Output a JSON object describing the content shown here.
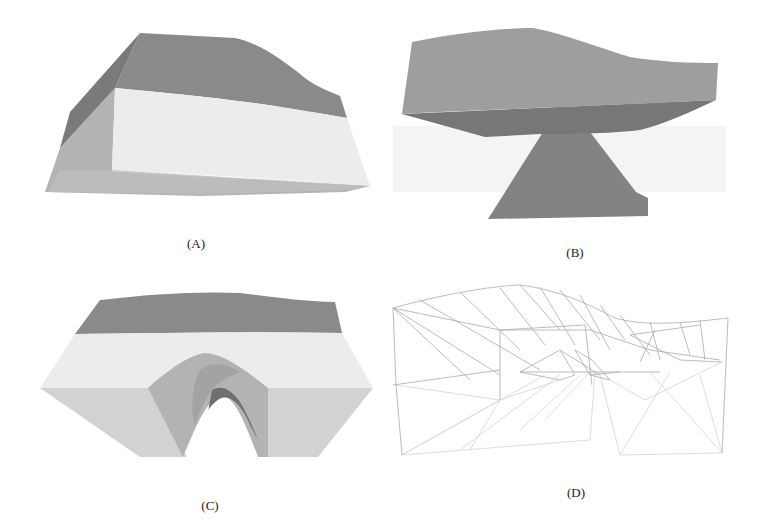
{
  "figure": {
    "panels": [
      {
        "id": "A",
        "label": "(A)",
        "description": "Shaded solid 3D model, oblique view, wavy top surface"
      },
      {
        "id": "B",
        "label": "(B)",
        "description": "Shaded solid 3D model, side view with pedestal beneath slab"
      },
      {
        "id": "C",
        "label": "(C)",
        "description": "Shaded solid 3D model, front view with arch cut-out"
      },
      {
        "id": "D",
        "label": "(D)",
        "description": "Wireframe triangulated mesh of the model"
      }
    ],
    "colors": {
      "dark_face": "#7d7d7d",
      "medium_face": "#a6a6a6",
      "light_face": "#e9e9e9",
      "lighter_face": "#c4c4c4",
      "background_band": "#f3f3f3",
      "wire": "#9a9a9a",
      "caption_text": "#1a1a1a"
    }
  }
}
